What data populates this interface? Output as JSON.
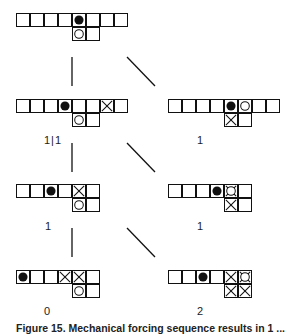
{
  "figure": {
    "caption": "Figure 15. Mechanical forcing sequence results in 1 ...",
    "cell_size": 14,
    "colors": {
      "line": "#111111",
      "black_stone": "#111111",
      "white_stone": "#ffffff"
    },
    "boards": [
      {
        "id": "top",
        "x": 16,
        "y": 13,
        "label": "",
        "rows": [
          [
            "empty",
            "empty",
            "empty",
            "empty",
            "black",
            "empty",
            "empty",
            "empty"
          ],
          [
            null,
            null,
            null,
            null,
            "white",
            "empty",
            null,
            null
          ]
        ]
      },
      {
        "id": "left-2",
        "x": 16,
        "y": 99,
        "label": "1|1",
        "label_x": 44,
        "label_y": 134,
        "rows": [
          [
            "empty",
            "empty",
            "empty",
            "black",
            "empty",
            "empty",
            "cross",
            "empty"
          ],
          [
            null,
            null,
            null,
            null,
            "white",
            "empty",
            null,
            null
          ]
        ]
      },
      {
        "id": "right-2",
        "x": 168,
        "y": 99,
        "label": "1",
        "label_x": 197,
        "label_y": 134,
        "rows": [
          [
            "empty",
            "empty",
            "empty",
            "empty",
            "black",
            "white",
            "empty",
            "empty"
          ],
          [
            null,
            null,
            null,
            null,
            "cross",
            "empty",
            null,
            null
          ]
        ]
      },
      {
        "id": "left-3",
        "x": 16,
        "y": 184,
        "label": "1",
        "label_x": 45,
        "label_y": 220,
        "rows": [
          [
            "empty",
            "empty",
            "black",
            "empty",
            "cross",
            "empty"
          ],
          [
            null,
            null,
            null,
            null,
            "white",
            "empty"
          ]
        ]
      },
      {
        "id": "right-3",
        "x": 168,
        "y": 184,
        "label": "1",
        "label_x": 197,
        "label_y": 220,
        "rows": [
          [
            "empty",
            "empty",
            "empty",
            "black",
            "cross-white",
            "empty"
          ],
          [
            null,
            null,
            null,
            null,
            "cross",
            "empty"
          ]
        ]
      },
      {
        "id": "left-4",
        "x": 16,
        "y": 270,
        "label": "0",
        "label_x": 44,
        "label_y": 305,
        "rows": [
          [
            "black",
            "empty",
            "empty",
            "cross",
            "cross",
            "empty"
          ],
          [
            null,
            null,
            null,
            null,
            "white",
            "empty"
          ]
        ]
      },
      {
        "id": "right-4",
        "x": 168,
        "y": 270,
        "label": "2",
        "label_x": 197,
        "label_y": 305,
        "rows": [
          [
            "empty",
            "empty",
            "black",
            "empty",
            "cross",
            "cross-white"
          ],
          [
            null,
            null,
            null,
            null,
            "cross",
            "cross"
          ]
        ]
      }
    ],
    "connectors": [
      {
        "x1": 72,
        "y1": 57,
        "x2": 72,
        "y2": 86
      },
      {
        "x1": 127,
        "y1": 57,
        "x2": 155,
        "y2": 86
      },
      {
        "x1": 72,
        "y1": 143,
        "x2": 72,
        "y2": 172
      },
      {
        "x1": 127,
        "y1": 143,
        "x2": 155,
        "y2": 172
      },
      {
        "x1": 72,
        "y1": 228,
        "x2": 72,
        "y2": 257
      },
      {
        "x1": 127,
        "y1": 228,
        "x2": 155,
        "y2": 257
      }
    ]
  }
}
